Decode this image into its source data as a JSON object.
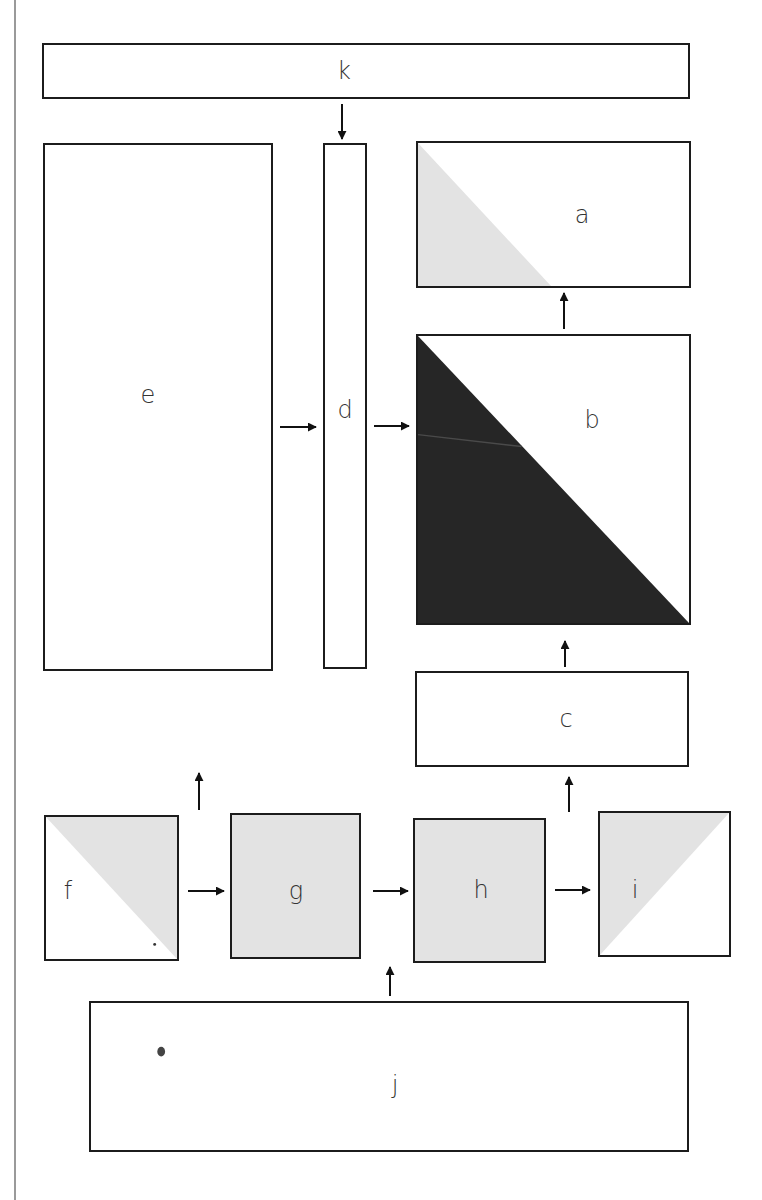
{
  "diagram": {
    "colors": {
      "border": "#1c1c1c",
      "light_fill": "#e3e3e3",
      "dark_fill": "#262626",
      "label": "#333333",
      "page_edge": "#9a9a9a"
    },
    "nodes": {
      "k": {
        "label": "k",
        "fill": "none"
      },
      "a": {
        "label": "a",
        "fill": "light triangle lower-left"
      },
      "b": {
        "label": "b",
        "fill": "dark triangle lower-left"
      },
      "c": {
        "label": "c",
        "fill": "none"
      },
      "d": {
        "label": "d",
        "fill": "none"
      },
      "e": {
        "label": "e",
        "fill": "none"
      },
      "f": {
        "label": "f",
        "fill": "light triangle upper-right"
      },
      "g": {
        "label": "g",
        "fill": "light full"
      },
      "h": {
        "label": "h",
        "fill": "light full"
      },
      "i": {
        "label": "i",
        "fill": "light triangle upper-left"
      },
      "j": {
        "label": "j",
        "fill": "none"
      }
    },
    "edges": [
      {
        "from": "k",
        "to": "d"
      },
      {
        "from": "e",
        "to": "d"
      },
      {
        "from": "d",
        "to": "b"
      },
      {
        "from": "b",
        "to": "a"
      },
      {
        "from": "c",
        "to": "b"
      },
      {
        "from": "i",
        "to": "c"
      },
      {
        "from": "f",
        "to": "g"
      },
      {
        "from": "g",
        "to": "h"
      },
      {
        "from": "h",
        "to": "i"
      },
      {
        "from": "j",
        "to": "h"
      },
      {
        "from": "f/g gap",
        "to": "e (upward)"
      }
    ]
  }
}
